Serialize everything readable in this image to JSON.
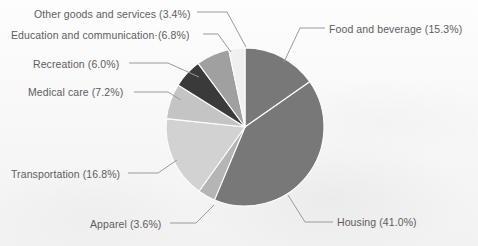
{
  "chart_data": {
    "type": "pie",
    "title": "",
    "subtitle": "",
    "xlabel": "",
    "ylabel": "",
    "legend_position": "none",
    "labels_position": "outside-with-leader-lines",
    "grid": false,
    "total_percent": 100.1,
    "categories": [
      "Food and beverage",
      "Housing",
      "Apparel",
      "Transportation",
      "Medical care",
      "Recreation",
      "Education and communication",
      "Other goods and services"
    ],
    "values": [
      15.3,
      41.0,
      3.6,
      16.8,
      7.2,
      6.0,
      6.8,
      3.4
    ],
    "slices": [
      {
        "name": "Food and beverage",
        "value": 15.3,
        "label": "Food and beverage (15.3%)",
        "color": "#787878",
        "start_angle_deg": 0.0,
        "end_angle_deg": 55.08
      },
      {
        "name": "Housing",
        "value": 41.0,
        "label": "Housing (41.0%)",
        "color": "#787878",
        "start_angle_deg": 55.08,
        "end_angle_deg": 202.68
      },
      {
        "name": "Apparel",
        "value": 3.6,
        "label": "Apparel (3.6%)",
        "color": "#b5b5b5",
        "start_angle_deg": 202.68,
        "end_angle_deg": 215.64
      },
      {
        "name": "Transportation",
        "value": 16.8,
        "label": "Transportation (16.8%)",
        "color": "#d2d2d2",
        "start_angle_deg": 215.64,
        "end_angle_deg": 276.12
      },
      {
        "name": "Medical care",
        "value": 7.2,
        "label": "Medical care (7.2%)",
        "color": "#c4c4c4",
        "start_angle_deg": 276.12,
        "end_angle_deg": 302.04
      },
      {
        "name": "Recreation",
        "value": 6.0,
        "label": "Recreation (6.0%)",
        "color": "#3a3a3a",
        "start_angle_deg": 302.04,
        "end_angle_deg": 323.64
      },
      {
        "name": "Education and communication",
        "value": 6.8,
        "label": "Education and communication·(6.8%)",
        "color": "#a0a0a0",
        "start_angle_deg": 323.64,
        "end_angle_deg": 348.12
      },
      {
        "name": "Other goods and services",
        "value": 3.4,
        "label": "Other goods and services (3.4%)",
        "color": "#f0f0f0",
        "start_angle_deg": 348.12,
        "end_angle_deg": 360.0
      }
    ],
    "geometry": {
      "center_x": 245,
      "center_y": 127,
      "radius": 79
    },
    "colors": {
      "background": "#fbfbfb",
      "label_text": "#5d5d5d",
      "leader_line": "#9a9a9a",
      "slice_border": "#fdfdfd"
    }
  }
}
